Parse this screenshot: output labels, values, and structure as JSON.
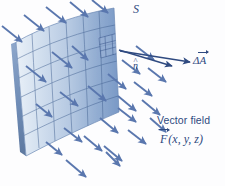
{
  "figure": {
    "title_label": "S",
    "background_color": "#fdfdfe",
    "ink_color": "#2f4a80",
    "arrow_color": "#5a77ae",
    "surface_colors": {
      "light": "#eef3fa",
      "mid": "#b9cbe4",
      "dark": "#7d99c4",
      "edge": "#5b7aa8",
      "grid": "#41608f"
    },
    "labels": {
      "surface": "S",
      "normal_vector": "n",
      "normal_hat": "^",
      "area_element_delta": "Δ",
      "area_element_symbol": "A",
      "vector_field_title": "Vector field",
      "vector_field_symbol": "F",
      "vector_field_args": "(x, y, z)"
    },
    "description": {
      "subject": "flux of a vector field through a curved surface",
      "surface_name": "S",
      "patch_name": "ΔA",
      "normal_name": "n-hat",
      "field_name": "F(x, y, z)",
      "arrow_count": 28
    }
  },
  "arrows": {
    "field": [
      {
        "x1": 2,
        "y1": 26,
        "x2": 22,
        "y2": 42
      },
      {
        "x1": 24,
        "y1": 15,
        "x2": 44,
        "y2": 31
      },
      {
        "x1": 46,
        "y1": 7,
        "x2": 66,
        "y2": 23
      },
      {
        "x1": 70,
        "y1": 2,
        "x2": 88,
        "y2": 17
      },
      {
        "x1": 92,
        "y1": 0,
        "x2": 108,
        "y2": 13
      },
      {
        "x1": 26,
        "y1": 66,
        "x2": 46,
        "y2": 82
      },
      {
        "x1": 52,
        "y1": 52,
        "x2": 72,
        "y2": 68
      },
      {
        "x1": 72,
        "y1": 46,
        "x2": 88,
        "y2": 60
      },
      {
        "x1": 36,
        "y1": 104,
        "x2": 52,
        "y2": 117
      },
      {
        "x1": 60,
        "y1": 92,
        "x2": 78,
        "y2": 106
      },
      {
        "x1": 88,
        "y1": 86,
        "x2": 106,
        "y2": 101
      },
      {
        "x1": 108,
        "y1": 74,
        "x2": 126,
        "y2": 89
      },
      {
        "x1": 122,
        "y1": 60,
        "x2": 140,
        "y2": 74
      },
      {
        "x1": 136,
        "y1": 46,
        "x2": 154,
        "y2": 60
      },
      {
        "x1": 118,
        "y1": 96,
        "x2": 136,
        "y2": 111
      },
      {
        "x1": 134,
        "y1": 82,
        "x2": 152,
        "y2": 96
      },
      {
        "x1": 148,
        "y1": 68,
        "x2": 166,
        "y2": 82
      },
      {
        "x1": 100,
        "y1": 118,
        "x2": 118,
        "y2": 133
      },
      {
        "x1": 118,
        "y1": 108,
        "x2": 136,
        "y2": 122
      },
      {
        "x1": 142,
        "y1": 100,
        "x2": 160,
        "y2": 115
      },
      {
        "x1": 64,
        "y1": 128,
        "x2": 82,
        "y2": 142
      },
      {
        "x1": 84,
        "y1": 136,
        "x2": 102,
        "y2": 151
      },
      {
        "x1": 104,
        "y1": 146,
        "x2": 122,
        "y2": 161
      },
      {
        "x1": 46,
        "y1": 142,
        "x2": 62,
        "y2": 155
      },
      {
        "x1": 128,
        "y1": 130,
        "x2": 146,
        "y2": 144
      },
      {
        "x1": 66,
        "y1": 160,
        "x2": 86,
        "y2": 177
      },
      {
        "x1": 106,
        "y1": 152,
        "x2": 120,
        "y2": 166
      },
      {
        "x1": 150,
        "y1": 118,
        "x2": 166,
        "y2": 132
      }
    ],
    "delta_a": {
      "x1": 120,
      "y1": 51,
      "x2": 190,
      "y2": 62
    },
    "normal": {
      "x1": 119,
      "y1": 50,
      "x2": 172,
      "y2": 66
    }
  }
}
